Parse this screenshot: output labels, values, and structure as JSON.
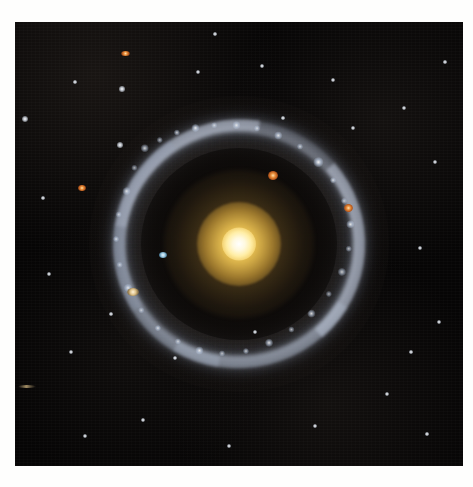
{
  "image": {
    "subject": "Hoag's Object",
    "kind": "ring-galaxy-photograph",
    "caption": "",
    "background_color": "#060505",
    "mat_color": "#fefefd",
    "plate": {
      "left": 15,
      "top": 22,
      "width": 448,
      "height": 444
    }
  },
  "galaxy": {
    "center": {
      "x": 239,
      "y": 222
    },
    "core": {
      "name": "golden-elliptical-nucleus",
      "bright_center_color": "#ffffff",
      "inner_color": "#ffeea8",
      "mid_color": "#eec452",
      "outer_color": "#a88036",
      "bright_radius_px": 17,
      "mid_radius_px": 42,
      "halo_radius_px": 75
    },
    "gap": {
      "name": "dark-inner-gap",
      "color": "#0a0807",
      "radius_px": 98
    },
    "ring": {
      "name": "blue-star-forming-ring",
      "color": "#c4ceE0",
      "glow_color": "#a8b2c6",
      "inner_radius_px": 113,
      "outer_radius_px": 126,
      "rotation_deg": -8,
      "knots": [
        {
          "x": 46,
          "y": 16,
          "r": 3.0,
          "o": 0.85
        },
        {
          "x": 62,
          "y": 10,
          "r": 2.2,
          "o": 0.7
        },
        {
          "x": 80,
          "y": 5,
          "r": 2.6,
          "o": 0.8
        },
        {
          "x": 99,
          "y": 3,
          "r": 3.4,
          "o": 0.92
        },
        {
          "x": 118,
          "y": 3,
          "r": 2.0,
          "o": 0.65
        },
        {
          "x": 140,
          "y": 6,
          "r": 2.8,
          "o": 0.78
        },
        {
          "x": 160,
          "y": 12,
          "r": 2.2,
          "o": 0.66
        },
        {
          "x": 180,
          "y": 22,
          "r": 3.0,
          "o": 0.84
        },
        {
          "x": 200,
          "y": 36,
          "r": 2.4,
          "o": 0.72
        },
        {
          "x": 216,
          "y": 54,
          "r": 3.6,
          "o": 0.95
        },
        {
          "x": 228,
          "y": 74,
          "r": 2.6,
          "o": 0.78
        },
        {
          "x": 236,
          "y": 96,
          "r": 2.2,
          "o": 0.68
        },
        {
          "x": 239,
          "y": 120,
          "r": 3.2,
          "o": 0.88
        },
        {
          "x": 234,
          "y": 144,
          "r": 2.4,
          "o": 0.72
        },
        {
          "x": 224,
          "y": 166,
          "r": 2.8,
          "o": 0.8
        },
        {
          "x": 208,
          "y": 186,
          "r": 2.2,
          "o": 0.66
        },
        {
          "x": 188,
          "y": 203,
          "r": 3.0,
          "o": 0.86
        },
        {
          "x": 166,
          "y": 216,
          "r": 2.4,
          "o": 0.72
        },
        {
          "x": 142,
          "y": 226,
          "r": 3.4,
          "o": 0.9
        },
        {
          "x": 118,
          "y": 231,
          "r": 2.6,
          "o": 0.76
        },
        {
          "x": 94,
          "y": 230,
          "r": 2.2,
          "o": 0.68
        },
        {
          "x": 72,
          "y": 224,
          "r": 3.0,
          "o": 0.84
        },
        {
          "x": 52,
          "y": 212,
          "r": 2.4,
          "o": 0.7
        },
        {
          "x": 34,
          "y": 196,
          "r": 2.6,
          "o": 0.76
        },
        {
          "x": 20,
          "y": 176,
          "r": 2.2,
          "o": 0.64
        },
        {
          "x": 10,
          "y": 152,
          "r": 2.8,
          "o": 0.8
        },
        {
          "x": 5,
          "y": 128,
          "r": 2.2,
          "o": 0.66
        },
        {
          "x": 5,
          "y": 102,
          "r": 2.6,
          "o": 0.74
        },
        {
          "x": 11,
          "y": 78,
          "r": 2.2,
          "o": 0.64
        },
        {
          "x": 22,
          "y": 56,
          "r": 2.8,
          "o": 0.78
        },
        {
          "x": 33,
          "y": 34,
          "r": 2.2,
          "o": 0.68
        }
      ]
    }
  },
  "field_objects": [
    {
      "name": "orange-edge-on-galaxy-upper",
      "x": 110,
      "y": 31,
      "w": 9,
      "h": 5,
      "type": "orange"
    },
    {
      "name": "orange-compact-galaxy-left",
      "x": 67,
      "y": 166,
      "w": 8,
      "h": 6,
      "type": "orange"
    },
    {
      "name": "orange-knot-inside-ring",
      "x": 258,
      "y": 153,
      "w": 10,
      "h": 9,
      "type": "orange"
    },
    {
      "name": "red-knot-ring-right",
      "x": 333,
      "y": 186,
      "w": 9,
      "h": 8,
      "type": "orange"
    },
    {
      "name": "tan-galaxy-lower-left",
      "x": 118,
      "y": 270,
      "w": 12,
      "h": 8,
      "type": "tan"
    },
    {
      "name": "blue-knot-mid-left",
      "x": 148,
      "y": 233,
      "w": 8,
      "h": 6,
      "type": "blue"
    },
    {
      "name": "faint-streak-lower-left",
      "x": 12,
      "y": 364,
      "w": 18,
      "h": 3,
      "type": "streak"
    }
  ],
  "stars": [
    {
      "x": 10,
      "y": 97,
      "r": 2.4
    },
    {
      "x": 107,
      "y": 67,
      "r": 1.8
    },
    {
      "x": 105,
      "y": 123,
      "r": 2.0
    },
    {
      "x": 183,
      "y": 50,
      "r": 1.6
    },
    {
      "x": 247,
      "y": 44,
      "r": 1.4
    },
    {
      "x": 318,
      "y": 58,
      "r": 1.5
    },
    {
      "x": 389,
      "y": 86,
      "r": 1.6
    },
    {
      "x": 420,
      "y": 140,
      "r": 1.4
    },
    {
      "x": 405,
      "y": 226,
      "r": 1.5
    },
    {
      "x": 424,
      "y": 300,
      "r": 1.6
    },
    {
      "x": 372,
      "y": 372,
      "r": 1.5
    },
    {
      "x": 300,
      "y": 404,
      "r": 1.4
    },
    {
      "x": 214,
      "y": 424,
      "r": 1.6
    },
    {
      "x": 128,
      "y": 398,
      "r": 1.4
    },
    {
      "x": 56,
      "y": 330,
      "r": 1.5
    },
    {
      "x": 34,
      "y": 252,
      "r": 1.4
    },
    {
      "x": 28,
      "y": 176,
      "r": 1.3
    },
    {
      "x": 70,
      "y": 414,
      "r": 1.4
    },
    {
      "x": 160,
      "y": 336,
      "r": 1.5
    },
    {
      "x": 338,
      "y": 106,
      "r": 1.4
    },
    {
      "x": 268,
      "y": 96,
      "r": 1.3
    },
    {
      "x": 96,
      "y": 292,
      "r": 1.3
    },
    {
      "x": 396,
      "y": 330,
      "r": 1.3
    },
    {
      "x": 240,
      "y": 310,
      "r": 1.4
    },
    {
      "x": 60,
      "y": 60,
      "r": 1.2
    },
    {
      "x": 430,
      "y": 40,
      "r": 1.2
    },
    {
      "x": 200,
      "y": 12,
      "r": 1.2
    },
    {
      "x": 412,
      "y": 412,
      "r": 1.2
    }
  ]
}
